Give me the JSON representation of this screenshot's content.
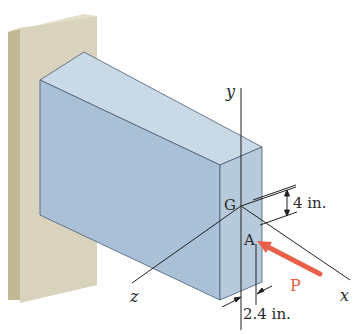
{
  "figure": {
    "labels": {
      "y_axis": "y",
      "x_axis": "x",
      "z_axis": "z",
      "centroid": "G",
      "load_point": "A",
      "load": "P",
      "dim_vertical": "4 in.",
      "dim_horizontal": "2.4 in."
    },
    "colors": {
      "wall_front": "#d9d2bd",
      "wall_side": "#c2b895",
      "block_top": "#c9d9e6",
      "block_side": "#a9c0d6",
      "block_end": "#b7cadb",
      "edge": "#4a5a72",
      "load_arrow": "#e8604a",
      "load_label": "#e8604a",
      "axis_line": "#222222"
    }
  }
}
